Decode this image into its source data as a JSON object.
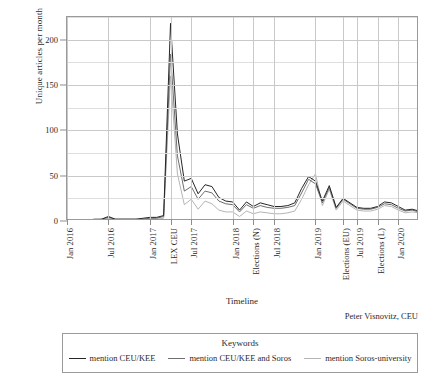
{
  "chart_data": {
    "type": "line",
    "title": "",
    "xlabel": "Timeline",
    "ylabel": "Unique articles per month",
    "ylim": [
      0,
      225
    ],
    "yticks": [
      0,
      50,
      100,
      150,
      200
    ],
    "ytick_labels": [
      "0",
      "50",
      "100",
      "150",
      "200"
    ],
    "y_minor_ticks": [
      25,
      75,
      125,
      175,
      225
    ],
    "grid": true,
    "legend_position": "below-plot",
    "legend_title": "Keywords",
    "categories": [
      "Jan 2016",
      "Feb 2016",
      "Mar 2016",
      "Apr 2016",
      "May 2016",
      "Jun 2016",
      "Jul 2016",
      "Aug 2016",
      "Sep 2016",
      "Oct 2016",
      "Nov 2016",
      "Dec 2016",
      "Jan 2017",
      "Feb 2017",
      "Mar 2017",
      "LEX CEU",
      "May 2017",
      "Jun 2017",
      "Jul 2017",
      "Aug 2017",
      "Sep 2017",
      "Oct 2017",
      "Nov 2017",
      "Dec 2017",
      "Jan 2018",
      "Feb 2018",
      "Mar 2018",
      "Elections (N)",
      "May 2018",
      "Jun 2018",
      "Jul 2018",
      "Aug 2018",
      "Sep 2018",
      "Oct 2018",
      "Nov 2018",
      "Dec 2018",
      "Jan 2019",
      "Feb 2019",
      "Mar 2019",
      "Apr 2019",
      "Elections (EU)",
      "Jun 2019",
      "Jul 2019",
      "Aug 2019",
      "Sep 2019",
      "Elections (L)",
      "Nov 2019",
      "Dec 2019",
      "Jan 2020",
      "Feb 2020",
      "Mar 2020",
      "Apr 2020"
    ],
    "xtick_labels": [
      "Jan 2016",
      "Jul 2016",
      "Jan 2017",
      "LEX CEU",
      "Jul 2017",
      "Jan 2018",
      "Elections (N)",
      "Jul 2018",
      "Jan 2019",
      "Elections (EU)",
      "Jul 2019",
      "Elections (L)",
      "Jan 2020"
    ],
    "xtick_indices": [
      0,
      6,
      12,
      15,
      18,
      24,
      27,
      30,
      36,
      40,
      42,
      45,
      48
    ],
    "series": [
      {
        "name": "mention CEU/KEE",
        "color": "#262626",
        "values": [
          1,
          1,
          1,
          1,
          2,
          2,
          5,
          2,
          2,
          2,
          2,
          3,
          4,
          4,
          6,
          218,
          96,
          44,
          47,
          30,
          40,
          38,
          26,
          22,
          21,
          12,
          21,
          16,
          20,
          18,
          16,
          16,
          17,
          20,
          36,
          49,
          44,
          22,
          39,
          15,
          25,
          20,
          15,
          14,
          14,
          16,
          21,
          20,
          16,
          12,
          13,
          11
        ]
      },
      {
        "name": "mention CEU/KEE and Soros",
        "color": "#6e6e6e",
        "values": [
          1,
          1,
          1,
          1,
          1,
          2,
          4,
          2,
          2,
          2,
          2,
          2,
          3,
          3,
          5,
          184,
          72,
          33,
          38,
          24,
          33,
          31,
          22,
          19,
          18,
          10,
          18,
          14,
          17,
          15,
          14,
          14,
          15,
          17,
          31,
          46,
          41,
          20,
          37,
          14,
          24,
          19,
          14,
          13,
          13,
          15,
          19,
          18,
          14,
          11,
          12,
          10
        ]
      },
      {
        "name": "mention Soros-university",
        "color": "#b5b5b5",
        "values": [
          0,
          0,
          0,
          0,
          1,
          1,
          3,
          1,
          1,
          1,
          1,
          1,
          2,
          2,
          3,
          160,
          52,
          18,
          24,
          13,
          22,
          19,
          12,
          10,
          10,
          5,
          11,
          8,
          10,
          9,
          8,
          8,
          9,
          11,
          24,
          40,
          52,
          17,
          35,
          12,
          22,
          17,
          12,
          11,
          11,
          13,
          17,
          16,
          12,
          9,
          10,
          9
        ]
      }
    ]
  },
  "credit": "Peter Visnovitz, CEU"
}
